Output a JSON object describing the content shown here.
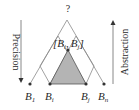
{
  "diagram": {
    "top_label": "?",
    "interval_label": {
      "open": "[",
      "left_base": "B",
      "left_sub": "i",
      "comma": ",",
      "right_base": "B",
      "right_sub": "j",
      "close": "]"
    },
    "left_axis_label": "Precision",
    "right_axis_label": "Abstraction",
    "nodes": [
      {
        "base": "B",
        "sub": "1"
      },
      {
        "base": "B",
        "sub": "i"
      },
      {
        "base": "B",
        "sub": "j"
      },
      {
        "base": "B",
        "sub": "n"
      }
    ],
    "colors": {
      "line": "#8a8a8a",
      "shade": "#b4b4b4",
      "shade_border": "#555555",
      "dot": "#333333",
      "text": "#2a2a2a"
    }
  }
}
